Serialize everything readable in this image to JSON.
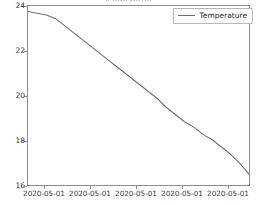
{
  "chart_data": {
    "type": "line",
    "title": "Temperature",
    "xlabel": "",
    "ylabel": "",
    "grid": false,
    "legend_position": "upper right",
    "legend": [
      "Temperature"
    ],
    "line_color": "#6e6e6e",
    "xticklabels": [
      "2020-05-01",
      "2020-05-01",
      "2020-05-01",
      "2020-05-01",
      "2020-05-01"
    ],
    "yticklabels": [
      "16",
      "18",
      "20",
      "22",
      "24"
    ],
    "ylim": [
      15.6,
      25.5
    ],
    "xlim": [
      0,
      24
    ],
    "series": [
      {
        "name": "Temperature",
        "x": [
          0,
          1,
          2,
          3,
          4,
          5,
          6,
          7,
          8,
          9,
          10,
          11,
          12,
          13,
          14,
          15,
          16,
          17,
          18,
          19,
          20,
          21,
          22,
          23,
          24
        ],
        "values": [
          25.2,
          25.1,
          25.0,
          24.8,
          24.4,
          24.0,
          23.6,
          23.2,
          22.8,
          22.4,
          22.0,
          21.6,
          21.2,
          20.8,
          20.4,
          19.9,
          19.5,
          19.1,
          18.8,
          18.4,
          18.1,
          17.7,
          17.3,
          16.8,
          16.2
        ]
      }
    ]
  },
  "ticks": {
    "y_positions_px": [
      181,
      136,
      91,
      46,
      1
    ],
    "x_positions_px": [
      30,
      76,
      122,
      168,
      214
    ]
  },
  "legend": {
    "swatch_name": "line-swatch",
    "label": "Temperature"
  }
}
